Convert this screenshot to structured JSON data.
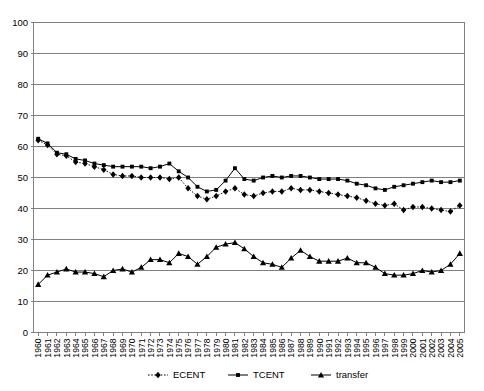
{
  "chart_data": {
    "type": "line",
    "title": "",
    "xlabel": "",
    "ylabel": "",
    "ylim": [
      0,
      100
    ],
    "ytick_step": 10,
    "yticks": [
      0,
      10,
      20,
      30,
      40,
      50,
      60,
      70,
      80,
      90,
      100
    ],
    "grid": true,
    "legend_position": "bottom",
    "categories": [
      "1960",
      "1961",
      "1962",
      "1963",
      "1964",
      "1965",
      "1966",
      "1967",
      "1968",
      "1969",
      "1970",
      "1971",
      "1972",
      "1973",
      "1974",
      "1975",
      "1976",
      "1977",
      "1978",
      "1979",
      "1980",
      "1981",
      "1982",
      "1983",
      "1984",
      "1985",
      "1986",
      "1987",
      "1988",
      "1989",
      "1990",
      "1991",
      "1992",
      "1993",
      "1994",
      "1995",
      "1996",
      "1997",
      "1998",
      "1999",
      "2000",
      "2001",
      "2002",
      "2003",
      "2004",
      "2005"
    ],
    "series": [
      {
        "name": "ECENT",
        "marker": "diamond",
        "line_style": "dotted",
        "color": "#000000",
        "values": [
          62.0,
          60.5,
          57.5,
          57.0,
          55.0,
          54.5,
          53.5,
          52.5,
          51.0,
          50.5,
          50.5,
          50.0,
          50.0,
          50.0,
          49.5,
          50.0,
          46.5,
          44.0,
          43.0,
          44.0,
          45.5,
          46.5,
          44.5,
          44.0,
          45.0,
          45.5,
          45.5,
          46.5,
          46.0,
          46.0,
          45.5,
          45.0,
          44.5,
          44.0,
          43.5,
          42.5,
          41.5,
          41.0,
          41.5,
          39.5,
          40.5,
          40.5,
          40.0,
          39.5,
          39.0,
          41.0
        ]
      },
      {
        "name": "TCENT",
        "marker": "square",
        "line_style": "solid",
        "color": "#000000",
        "values": [
          62.5,
          61.0,
          58.0,
          57.5,
          56.0,
          55.5,
          54.5,
          54.0,
          53.5,
          53.5,
          53.5,
          53.5,
          53.0,
          53.5,
          54.5,
          52.0,
          50.0,
          47.0,
          45.5,
          46.0,
          49.0,
          53.0,
          49.5,
          49.0,
          50.0,
          50.5,
          50.0,
          50.5,
          50.5,
          50.0,
          49.5,
          49.5,
          49.5,
          49.0,
          48.0,
          47.5,
          46.5,
          46.0,
          47.0,
          47.5,
          48.0,
          48.5,
          49.0,
          48.5,
          48.5,
          49.0
        ]
      },
      {
        "name": "transfer",
        "marker": "triangle",
        "line_style": "solid",
        "color": "#000000",
        "values": [
          15.5,
          18.5,
          19.5,
          20.5,
          19.5,
          19.5,
          19.0,
          18.0,
          20.0,
          20.5,
          19.5,
          21.0,
          23.5,
          23.5,
          22.5,
          25.5,
          24.5,
          22.0,
          24.5,
          27.5,
          28.5,
          29.0,
          27.0,
          24.5,
          22.5,
          22.0,
          21.0,
          24.0,
          26.5,
          24.5,
          23.0,
          23.0,
          23.0,
          24.0,
          22.5,
          22.5,
          21.0,
          19.0,
          18.5,
          18.5,
          19.0,
          20.0,
          19.5,
          20.0,
          22.0,
          25.5
        ]
      }
    ]
  },
  "legend": {
    "items": [
      {
        "label": "ECENT"
      },
      {
        "label": "TCENT"
      },
      {
        "label": "transfer"
      }
    ]
  },
  "axis": {
    "y_labels": [
      "100",
      "90",
      "80",
      "70",
      "60",
      "50",
      "40",
      "30",
      "20",
      "10",
      "0"
    ]
  }
}
